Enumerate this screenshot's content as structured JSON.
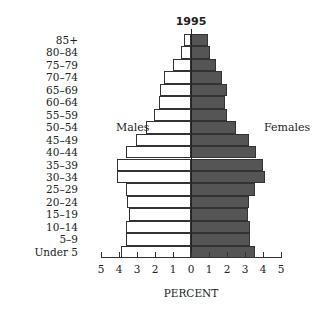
{
  "chart_data": {
    "type": "bar",
    "subtype": "population-pyramid",
    "title": "1995",
    "xlabel": "PERCENT",
    "ylabel": "",
    "xlim": [
      -5,
      5
    ],
    "x_ticks": [
      "5",
      "4",
      "3",
      "2",
      "1",
      "0",
      "1",
      "2",
      "3",
      "4",
      "5"
    ],
    "grid": false,
    "side_labels": {
      "left": "Males",
      "right": "Females"
    },
    "categories": [
      "85+",
      "80–84",
      "75–79",
      "70–74",
      "65–69",
      "60–64",
      "55–59",
      "50–54",
      "45–49",
      "40–44",
      "35–39",
      "30–34",
      "25–29",
      "20–24",
      "15–19",
      "10–14",
      "5–9",
      "Under 5"
    ],
    "series": [
      {
        "name": "Males",
        "color": "#ffffff",
        "values": [
          0.4,
          0.55,
          1.0,
          1.5,
          1.7,
          1.8,
          2.05,
          2.5,
          3.05,
          3.6,
          4.1,
          4.1,
          3.6,
          3.55,
          3.45,
          3.6,
          3.6,
          3.9
        ]
      },
      {
        "name": "Females",
        "color": "#555555",
        "values": [
          0.95,
          1.05,
          1.4,
          1.7,
          2.0,
          1.9,
          2.0,
          2.5,
          3.2,
          3.6,
          4.0,
          4.1,
          3.55,
          3.2,
          3.15,
          3.3,
          3.3,
          3.55
        ]
      }
    ]
  }
}
